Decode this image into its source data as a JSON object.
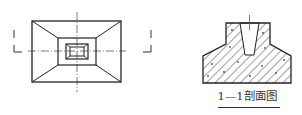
{
  "figure": {
    "plan_view": {
      "section_marks": [
        "1",
        "1"
      ]
    },
    "section_view": {
      "caption": "1—1剖面图"
    },
    "colors": {
      "line": "#222222",
      "hatch": "#444444",
      "background": "#ffffff"
    }
  }
}
